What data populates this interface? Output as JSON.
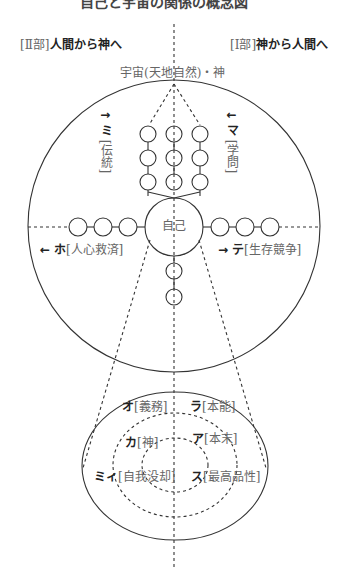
{
  "header": {
    "title_cutoff": "自己と宇宙の関係の概念図"
  },
  "parts": {
    "left": {
      "prefix": "[Ⅱ部]",
      "title": "人間から神へ"
    },
    "right": {
      "prefix": "[Ⅰ部]",
      "title": "神から人間へ"
    }
  },
  "top_label": "宇宙(天地自然)・神",
  "center_label": "自己",
  "directions": {
    "up_left": {
      "arrow": "↑",
      "kana": "ミ",
      "term": "[伝統]"
    },
    "down_right": {
      "arrow": "↓",
      "kana": "マ",
      "term": "[学問]"
    },
    "left": {
      "arrow": "←",
      "kana": "ホ",
      "term": "[人心救済]"
    },
    "right": {
      "arrow": "→",
      "kana": "テ",
      "term": "[生存競争]"
    }
  },
  "inner_ellipse": {
    "outer_ring": [
      {
        "kana": "オ",
        "term": "[義務]"
      },
      {
        "kana": "ラ",
        "term": "[本能]"
      }
    ],
    "middle_ring": [
      {
        "kana": "カ",
        "term": "[神]"
      },
      {
        "kana": "ア",
        "term": "[本末]"
      }
    ],
    "inner_ring": [
      {
        "kana": "ミィ",
        "term": "[自我没却]"
      },
      {
        "kana": "ス",
        "term": "[最高品性]"
      }
    ]
  },
  "colors": {
    "line": "#333333",
    "text_bold": "#222222",
    "text_light": "#666666"
  }
}
